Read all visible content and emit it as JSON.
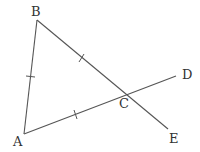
{
  "figure": {
    "type": "geometry-diagram",
    "points": {
      "A": {
        "label": "A",
        "x": 24,
        "y": 134
      },
      "B": {
        "label": "B",
        "x": 37,
        "y": 20
      },
      "C": {
        "label": "C",
        "x": 127,
        "y": 96
      },
      "D": {
        "label": "D",
        "x": 176,
        "y": 76
      },
      "E": {
        "label": "E",
        "x": 168,
        "y": 129
      }
    },
    "segments": [
      "AB",
      "BE",
      "AD"
    ],
    "equal_marks": [
      "AB",
      "BC",
      "AC"
    ],
    "stroke_color": "#555555",
    "label_color": "#333333"
  }
}
